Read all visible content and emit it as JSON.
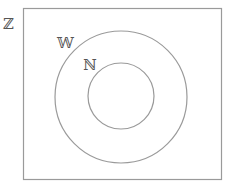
{
  "diagram": {
    "type": "venn",
    "title": "",
    "sets": [
      {
        "id": "Z",
        "label": "ℤ",
        "shape": "rectangle"
      },
      {
        "id": "W",
        "label": "𝕎",
        "shape": "circle",
        "inside": "Z"
      },
      {
        "id": "N",
        "label": "ℕ",
        "shape": "circle",
        "inside": "W"
      }
    ],
    "labels": {
      "universe": "ℤ",
      "outer": "𝕎",
      "inner": "ℕ"
    },
    "colors": {
      "stroke": "#9a9a9a",
      "text": "#555555",
      "background": "#ffffff"
    }
  }
}
